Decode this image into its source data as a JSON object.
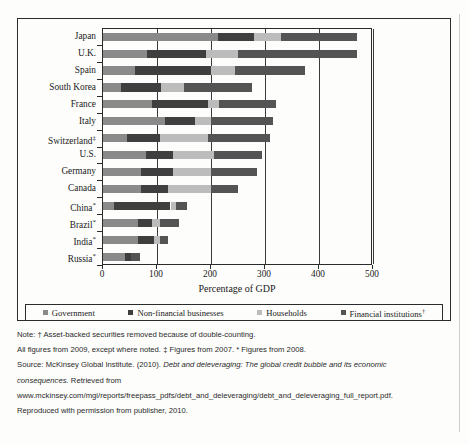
{
  "chart_data": {
    "type": "bar",
    "orientation": "horizontal",
    "stacked": true,
    "title": "",
    "xlabel": "Percentage of GDP",
    "ylabel": "",
    "xlim": [
      0,
      500
    ],
    "xticks": [
      0,
      100,
      200,
      300,
      400,
      500
    ],
    "xtick_labels": [
      "0",
      "100",
      "200",
      "300",
      "400",
      "500"
    ],
    "grid": true,
    "legend_position": "bottom",
    "categories": [
      "Japan",
      "U.K.",
      "Spain",
      "South Korea",
      "France",
      "Italy",
      "Switzerland‡",
      "U.S.",
      "Germany",
      "Canada",
      "China*",
      "Brazil*",
      "India*",
      "Russia*"
    ],
    "series": [
      {
        "name": "Government",
        "color": "#8a8a8a",
        "values": [
          213,
          81,
          60,
          33,
          90,
          115,
          45,
          80,
          70,
          70,
          20,
          65,
          65,
          40
        ]
      },
      {
        "name": "Non-financial businesses",
        "color": "#3f3f3f",
        "values": [
          67,
          109,
          140,
          74,
          105,
          55,
          60,
          50,
          60,
          50,
          105,
          25,
          30,
          12
        ]
      },
      {
        "name": "Households",
        "color": "#bcbcbc",
        "values": [
          50,
          60,
          45,
          43,
          20,
          30,
          90,
          75,
          70,
          80,
          10,
          15,
          10,
          0
        ]
      },
      {
        "name": "Financial institutions†",
        "color": "#545454",
        "values": [
          140,
          220,
          130,
          125,
          105,
          115,
          115,
          90,
          85,
          50,
          20,
          35,
          15,
          16
        ]
      }
    ],
    "totals": [
      470,
      470,
      375,
      275,
      320,
      315,
      310,
      295,
      285,
      250,
      155,
      140,
      120,
      68
    ]
  },
  "legend": {
    "items": [
      {
        "label": "Government",
        "color": "#8a8a8a"
      },
      {
        "label": "Non-financial businesses",
        "color": "#3f3f3f"
      },
      {
        "label": "Households",
        "color": "#bcbcbc"
      },
      {
        "label": "Financial institutions†",
        "color": "#545454"
      }
    ]
  },
  "axis": {
    "x_title": "Percentage of GDP"
  },
  "notes": {
    "line1": "Note: † Asset-backed securities removed because of double-counting.",
    "line2": "All figures from 2009, except where noted. ‡ Figures from 2007. * Figures from 2008.",
    "line3_prefix": "Source: McKinsey Global Institute. (2010). ",
    "line3_italic": "Debt and deleveraging: The global credit bubble and its economic",
    "line4_italic": "consequences.",
    "line4_suffix": " Retrieved from",
    "line5": "www.mckinsey.com/mgi/reports/freepass_pdfs/debt_and_deleveraging/debt_and_deleveraging_full_report.pdf.",
    "line6": "Reproduced with permission from publisher, 2010."
  }
}
